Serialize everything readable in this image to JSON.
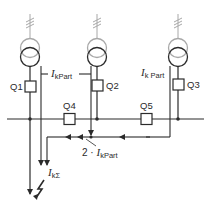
{
  "diagram": {
    "title": "",
    "colors": {
      "line": "#2b2b2b",
      "transformer_primary": "#a8a8a8",
      "background": "#ffffff"
    },
    "feeders": [
      {
        "id": "T1",
        "breaker_label": "Q1"
      },
      {
        "id": "T2",
        "breaker_label": "Q2"
      },
      {
        "id": "T3",
        "breaker_label": "Q3"
      }
    ],
    "busbar_breakers": [
      {
        "label": "Q4"
      },
      {
        "label": "Q5"
      }
    ],
    "currents": {
      "partial_left": {
        "symbol": "I",
        "subscript": "kPart"
      },
      "partial_right": {
        "symbol": "I",
        "subscript": "k Part"
      },
      "combined": {
        "prefix": "2 · ",
        "symbol": "I",
        "subscript": "kPart"
      },
      "total": {
        "symbol": "I",
        "subscript": "kΣ"
      }
    },
    "fault_symbol": "lightning-bolt"
  }
}
